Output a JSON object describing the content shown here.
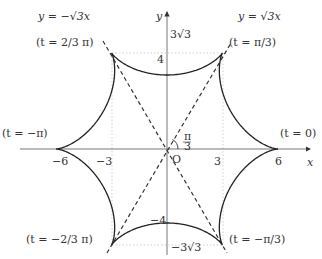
{
  "diagram": {
    "origin_px": [
      167,
      149
    ],
    "unit_px": 18.5,
    "curve": {
      "param_x": "5cos t + cos 5t",
      "param_y": "5sin t - sin 5t",
      "t_range": [
        -3.14159,
        3.14159
      ],
      "color": "#222222"
    },
    "axes": {
      "x_label": "x",
      "y_label": "y",
      "origin_label": "O",
      "x_ticks": [
        {
          "value": -6,
          "label": "−6"
        },
        {
          "value": -3,
          "label": "−3"
        },
        {
          "value": 3,
          "label": "3"
        },
        {
          "value": 6,
          "label": "6"
        }
      ],
      "y_ticks": [
        {
          "value": 4,
          "label": "4"
        },
        {
          "value": 5.196,
          "label": "3√3"
        },
        {
          "value": -4,
          "label": "−4"
        },
        {
          "value": -5.196,
          "label": "−3√3"
        }
      ]
    },
    "lines": [
      {
        "label": "y = √3x",
        "slope": 1.732
      },
      {
        "label": "y = −√3x",
        "slope": -1.732
      }
    ],
    "angle_label": "π/3",
    "cusp_labels": [
      {
        "text": "(t = 0)",
        "t": 0
      },
      {
        "text": "(t = π/3)",
        "t": "π/3"
      },
      {
        "text": "(t = 2/3 π)",
        "t": "2π/3"
      },
      {
        "text": "(t = −π)",
        "t": "-π"
      },
      {
        "text": "(t = −2/3 π)",
        "t": "-2π/3"
      },
      {
        "text": "(t = −π/3)",
        "t": "-π/3"
      }
    ]
  }
}
